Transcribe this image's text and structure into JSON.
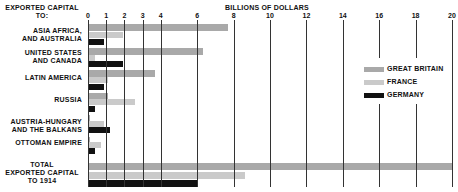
{
  "chart_data": {
    "type": "bar",
    "orientation": "horizontal",
    "title": "",
    "ylabel": "EXPORTED CAPITAL TO:",
    "xlabel": "BILLIONS OF DOLLARS",
    "xlim": [
      0,
      20
    ],
    "xticks": [
      0,
      1,
      2,
      3,
      4,
      6,
      8,
      10,
      12,
      14,
      16,
      18,
      20
    ],
    "grid": true,
    "legend_position": "right",
    "categories": [
      "ASIA AFRICA, AND AUSTRALIA",
      "UNITED STATES AND CANADA",
      "LATIN AMERICA",
      "RUSSIA",
      "AUSTRIA-HUNGARY AND THE BALKANS",
      "OTTOMAN EMPIRE",
      "TOTAL EXPORTED CAPITAL TO 1914"
    ],
    "series": [
      {
        "name": "GREAT BRITAIN",
        "color": "#a9a9a9",
        "values": [
          7.7,
          6.3,
          3.7,
          1.1,
          0.1,
          0.1,
          20.0
        ]
      },
      {
        "name": "FRANCE",
        "color": "#cacaca",
        "values": [
          1.9,
          0.4,
          1.1,
          2.6,
          0.9,
          0.7,
          8.6
        ]
      },
      {
        "name": "GERMANY",
        "color": "#111111",
        "values": [
          0.9,
          1.9,
          0.9,
          0.4,
          1.2,
          0.4,
          6.0
        ]
      }
    ]
  },
  "labels": {
    "y_title_line1": "EXPORTED CAPITAL",
    "y_title_line2": "TO:",
    "x_title": "BILLIONS OF DOLLARS",
    "rows": [
      [
        "ASIA AFRICA,",
        "AND AUSTRALIA"
      ],
      [
        "UNITED STATES",
        "AND CANADA"
      ],
      [
        "LATIN AMERICA"
      ],
      [
        "RUSSIA"
      ],
      [
        "AUSTRIA-HUNGARY",
        "AND THE BALKANS"
      ],
      [
        "OTTOMAN EMPIRE"
      ],
      [
        "TOTAL",
        "EXPORTED CAPITAL",
        "TO 1914"
      ]
    ]
  }
}
